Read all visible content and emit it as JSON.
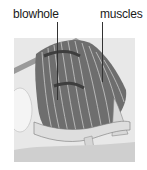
{
  "diagram": {
    "labels": [
      {
        "text": "blowhole",
        "x": 13,
        "y": 7,
        "leader_x": 57,
        "leader_y1": 22,
        "leader_y2": 100
      },
      {
        "text": "muscles",
        "x": 100,
        "y": 7,
        "leader_x": 102,
        "leader_y1": 22,
        "leader_y2": 82
      }
    ],
    "illustration": "cutaway of dolphin head showing blowhole and striated muscles",
    "colors": {
      "background": "#ffffff",
      "panel": "#e6e6e6",
      "muscle_dark": "#5a5a5a",
      "muscle_light": "#b5b5b5",
      "line": "#333333"
    }
  }
}
